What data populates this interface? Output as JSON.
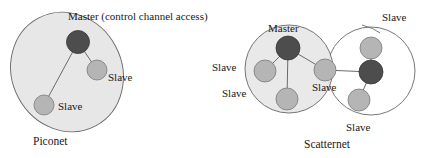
{
  "figure": {
    "colors": {
      "master_node_fill": "#4d4d4d",
      "slave_node_fill": "#b3b3b3",
      "cluster_fill_shaded": "#e6e6e6",
      "cluster_fill_plain": "#ffffff",
      "outline": "#555555",
      "link": "#666666",
      "text": "#1a1a1a",
      "background": "#ffffff"
    }
  },
  "piconet": {
    "caption": "Piconet",
    "header_label": "Master (control channel access)",
    "nodes": [
      {
        "id": "p-master",
        "role": "master",
        "label": "",
        "cx": 78,
        "cy": 42,
        "r": 11.5
      },
      {
        "id": "p-slave-right",
        "role": "slave",
        "label": "Slave",
        "cx": 97,
        "cy": 70,
        "r": 10
      },
      {
        "id": "p-slave-bottom",
        "role": "slave",
        "label": "Slave",
        "cx": 44,
        "cy": 105,
        "r": 10
      }
    ],
    "links": [
      {
        "from": "p-master",
        "to": "p-slave-right"
      },
      {
        "from": "p-master",
        "to": "p-slave-bottom"
      }
    ],
    "labels": {
      "slave_right": "Slave",
      "slave_bottom": "Slave"
    }
  },
  "scatternet": {
    "caption": "Scatternet",
    "left_piconet": {
      "master_label": "Master",
      "nodes": [
        {
          "id": "s-master-left",
          "role": "master",
          "cx": 288,
          "cy": 48,
          "r": 12
        },
        {
          "id": "s-slave-left",
          "role": "slave",
          "cx": 265,
          "cy": 71,
          "r": 11
        },
        {
          "id": "s-slave-bottom",
          "role": "slave",
          "cx": 287,
          "cy": 99,
          "r": 11
        },
        {
          "id": "s-bridge",
          "role": "slave",
          "cx": 325,
          "cy": 70,
          "r": 11
        }
      ],
      "labels": {
        "slave_left": "Slave",
        "slave_bottom_left": "Slave"
      }
    },
    "right_piconet": {
      "nodes": [
        {
          "id": "s-master-right",
          "role": "master",
          "cx": 371,
          "cy": 72,
          "r": 12
        },
        {
          "id": "s-slave-top-right",
          "role": "slave",
          "cx": 371,
          "cy": 48,
          "r": 11
        },
        {
          "id": "s-slave-bottom-right",
          "role": "slave",
          "cx": 359,
          "cy": 100,
          "r": 11
        }
      ],
      "labels": {
        "slave_top_right": "Slave",
        "slave_bottom_right": "Slave"
      }
    },
    "bridge_label": "Slave"
  }
}
